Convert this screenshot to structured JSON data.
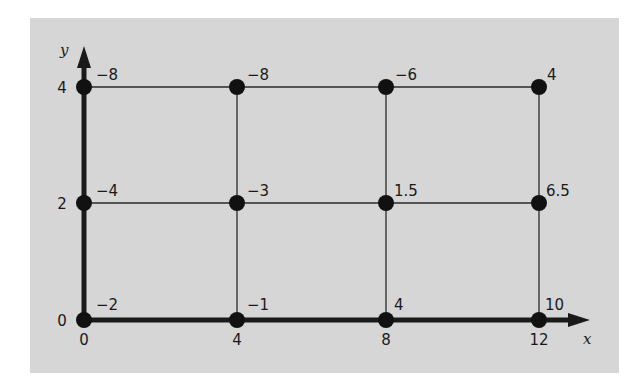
{
  "diagram": {
    "axes": {
      "x_label": "x",
      "y_label": "y",
      "x_ticks": [
        "0",
        "4",
        "8",
        "12"
      ],
      "y_ticks": [
        "0",
        "2",
        "4"
      ]
    },
    "nodes": [
      {
        "x": 0,
        "y": 4,
        "value": "−8"
      },
      {
        "x": 4,
        "y": 4,
        "value": "−8"
      },
      {
        "x": 8,
        "y": 4,
        "value": "−6"
      },
      {
        "x": 12,
        "y": 4,
        "value": "4"
      },
      {
        "x": 0,
        "y": 2,
        "value": "−4"
      },
      {
        "x": 4,
        "y": 2,
        "value": "−3"
      },
      {
        "x": 8,
        "y": 2,
        "value": "1.5"
      },
      {
        "x": 12,
        "y": 2,
        "value": "6.5"
      },
      {
        "x": 0,
        "y": 0,
        "value": "−2"
      },
      {
        "x": 4,
        "y": 0,
        "value": "−1"
      },
      {
        "x": 8,
        "y": 0,
        "value": "4"
      },
      {
        "x": 12,
        "y": 0,
        "value": "10"
      }
    ],
    "colors": {
      "panel": "#d6d6d6",
      "ink": "#1a1a1a"
    }
  }
}
